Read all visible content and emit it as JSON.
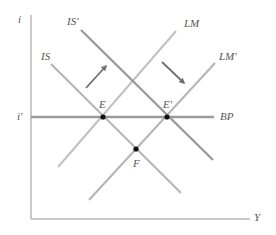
{
  "diagram": {
    "axes": {
      "y_label": "i",
      "x_label": "Y",
      "y_tick_label": "i'",
      "axis_color": "#c8c8c8"
    },
    "curves": [
      {
        "id": "IS",
        "label": "IS",
        "color": "#b4b4b4"
      },
      {
        "id": "IS_prime",
        "label": "IS'",
        "color": "#9a9a9a"
      },
      {
        "id": "LM",
        "label": "LM",
        "color": "#c0c0c0"
      },
      {
        "id": "LM_prime",
        "label": "LM'",
        "color": "#b4b4b4"
      },
      {
        "id": "BP",
        "label": "BP",
        "color": "#9a9a9a"
      }
    ],
    "points": [
      {
        "id": "E",
        "label": "E"
      },
      {
        "id": "E_prime",
        "label": "E'"
      },
      {
        "id": "F",
        "label": "F"
      }
    ],
    "arrows": [
      {
        "id": "IS-shift",
        "direction": "up-right"
      },
      {
        "id": "LM-shift",
        "direction": "down-right"
      }
    ],
    "colors": {
      "point": "#111111",
      "arrow": "#707070",
      "label": "#555555"
    }
  }
}
